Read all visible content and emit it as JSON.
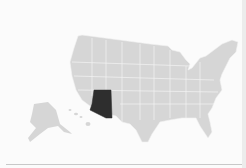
{
  "map": {
    "subject": "United States",
    "highlighted_state": "Arizona",
    "colors": {
      "background": "#fbfbfb",
      "state_fill": "#d6d6d6",
      "state_border": "#f4f4f4",
      "highlight_fill": "#2e2e2e"
    }
  }
}
